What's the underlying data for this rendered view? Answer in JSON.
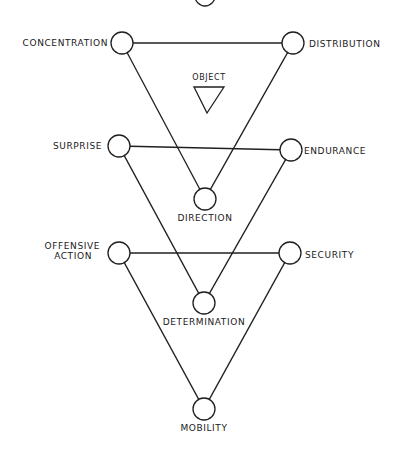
{
  "diagram": {
    "object_label": "OBJECT",
    "nodes": [
      {
        "id": "top",
        "label": ""
      },
      {
        "id": "concentration",
        "label": "CONCENTRATION"
      },
      {
        "id": "distribution",
        "label": "DISTRIBUTION"
      },
      {
        "id": "surprise",
        "label": "SURPRISE"
      },
      {
        "id": "endurance",
        "label": "ENDURANCE"
      },
      {
        "id": "direction",
        "label": "DIRECTION"
      },
      {
        "id": "offensive",
        "label_line1": "OFFENSIVE",
        "label_line2": "ACTION"
      },
      {
        "id": "security",
        "label": "SECURITY"
      },
      {
        "id": "determination",
        "label": "DETERMINATION"
      },
      {
        "id": "mobility",
        "label": "MOBILITY"
      }
    ],
    "edges": [
      [
        "concentration",
        "distribution"
      ],
      [
        "concentration",
        "direction"
      ],
      [
        "distribution",
        "direction"
      ],
      [
        "surprise",
        "endurance"
      ],
      [
        "surprise",
        "determination"
      ],
      [
        "endurance",
        "determination"
      ],
      [
        "offensive",
        "security"
      ],
      [
        "offensive",
        "mobility"
      ],
      [
        "security",
        "mobility"
      ]
    ]
  }
}
